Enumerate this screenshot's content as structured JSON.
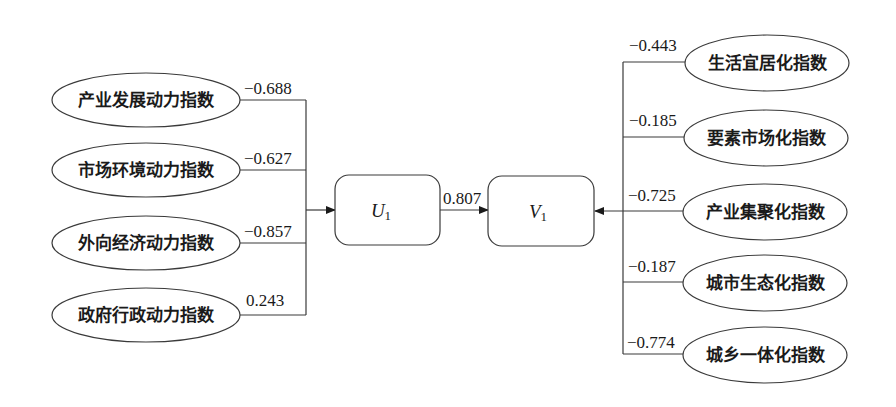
{
  "diagram": {
    "left_indicators": [
      {
        "label": "产业发展动力指数",
        "loading": "−0.688"
      },
      {
        "label": "市场环境动力指数",
        "loading": "−0.627"
      },
      {
        "label": "外向经济动力指数",
        "loading": "−0.857"
      },
      {
        "label": "政府行政动力指数",
        "loading": "0.243"
      }
    ],
    "u_variable": {
      "name": "U",
      "subscript": "1"
    },
    "v_variable": {
      "name": "V",
      "subscript": "1"
    },
    "canonical_correlation": "0.807",
    "right_indicators": [
      {
        "label": "生活宜居化指数",
        "loading": "−0.443"
      },
      {
        "label": "要素市场化指数",
        "loading": "−0.185"
      },
      {
        "label": "产业集聚化指数",
        "loading": "−0.725"
      },
      {
        "label": "城市生态化指数",
        "loading": "−0.187"
      },
      {
        "label": "城乡一体化指数",
        "loading": "−0.774"
      }
    ]
  }
}
